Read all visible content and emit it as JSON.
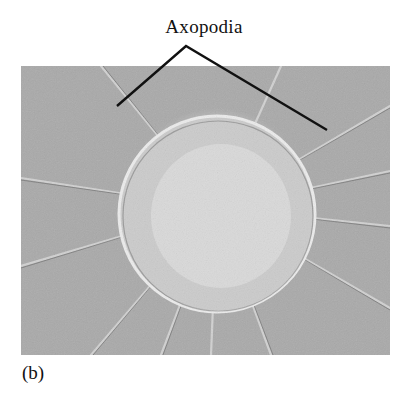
{
  "figure": {
    "label": "Axopodia",
    "caption": "(b)",
    "image_description": "Micrograph of a heliozoan cell with radiating axopodia",
    "leader_line_color": "#111111"
  }
}
